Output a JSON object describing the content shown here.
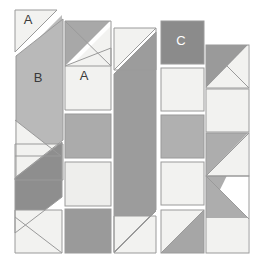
{
  "figure": {
    "type": "geometric-tile-diagram",
    "width": 256,
    "height": 266,
    "background": "#ffffff",
    "stroke": "#9a9a9a",
    "stroke_width": 1
  },
  "palette": {
    "white": "#f4f4f2",
    "light": "#ededea",
    "light2": "#e8e8e5",
    "mid_light": "#cccccc",
    "mid": "#b4b4b4",
    "mid_gray": "#a8a8a8",
    "gray": "#9c9c9c",
    "dark_gray": "#8e8e8e",
    "darker": "#848484",
    "outline": "#8f8f8f",
    "label_dark": "#3a3a3a",
    "label_light": "#ffffff"
  },
  "labels": [
    {
      "id": "label-a1",
      "text": "A",
      "x": 28,
      "y": 21,
      "color": "#3a3a3a"
    },
    {
      "id": "label-b",
      "text": "B",
      "x": 38,
      "y": 79,
      "color": "#3a3a3a"
    },
    {
      "id": "label-a2",
      "text": "A",
      "x": 84,
      "y": 77,
      "color": "#3a3a3a"
    },
    {
      "id": "label-c",
      "text": "C",
      "x": 181,
      "y": 42,
      "color": "#ffffff"
    }
  ],
  "columns": [
    {
      "id": "column-1",
      "x": 14,
      "width": 50,
      "top": 9,
      "bottom": 253,
      "tiles": [
        {
          "id": "c1-tile-1",
          "kind": "diagonal-split",
          "fill_a": "#f2f2f0",
          "fill_b": "#b9b9b9"
        },
        {
          "id": "c1-tile-2",
          "kind": "parallelogram",
          "fill_a": "#b9b9b9"
        },
        {
          "id": "c1-tile-3",
          "kind": "diagonal-split",
          "fill_a": "#f2f2f0",
          "fill_b": "#f2f2f0"
        },
        {
          "id": "c1-tile-4",
          "kind": "parallelogram",
          "fill_a": "#8e8e8e"
        },
        {
          "id": "c1-tile-5",
          "kind": "diagonal-split",
          "fill_a": "#f2f2f0",
          "fill_b": "#f2f2f0"
        }
      ]
    },
    {
      "id": "column-2",
      "x": 64,
      "width": 48,
      "top": 20,
      "bottom": 253,
      "tiles": [
        {
          "id": "c2-tile-1",
          "kind": "diagonal-split",
          "fill_a": "#a8a8a8",
          "fill_b": "#f2f2f0"
        },
        {
          "id": "c2-tile-2",
          "kind": "square",
          "fill_a": "#f2f2f0"
        },
        {
          "id": "c2-tile-3",
          "kind": "square",
          "fill_a": "#ababab"
        },
        {
          "id": "c2-tile-4",
          "kind": "square",
          "fill_a": "#eeeeec"
        },
        {
          "id": "c2-tile-5",
          "kind": "square",
          "fill_a": "#9a9a9a"
        }
      ]
    },
    {
      "id": "column-3",
      "x": 113,
      "width": 45,
      "top": 27,
      "bottom": 253,
      "tiles": [
        {
          "id": "c3-tile-1",
          "kind": "diagonal-split",
          "fill_a": "#f2f2f0",
          "fill_b": "#9c9c9c"
        },
        {
          "id": "c3-tile-2",
          "kind": "parallelogram",
          "fill_a": "#9c9c9c"
        },
        {
          "id": "c3-tile-3",
          "kind": "diagonal-split",
          "fill_a": "#f2f2f0",
          "fill_b": "#f2f2f0"
        }
      ]
    },
    {
      "id": "column-4",
      "x": 160,
      "width": 44,
      "top": 20,
      "bottom": 253,
      "tiles": [
        {
          "id": "c4-tile-1",
          "kind": "square",
          "fill_a": "#8b8b8b"
        },
        {
          "id": "c4-tile-2",
          "kind": "square",
          "fill_a": "#f2f2f0"
        },
        {
          "id": "c4-tile-3",
          "kind": "square",
          "fill_a": "#b0b0b0"
        },
        {
          "id": "c4-tile-4",
          "kind": "square",
          "fill_a": "#f2f2f0"
        },
        {
          "id": "c4-tile-5",
          "kind": "diagonal-split",
          "fill_a": "#f2f2f0",
          "fill_b": "#a6a6a6"
        }
      ]
    },
    {
      "id": "column-5",
      "x": 205,
      "width": 45,
      "top": 44,
      "bottom": 253,
      "tiles": [
        {
          "id": "c5-tile-1",
          "kind": "diagonal-split",
          "fill_a": "#9a9a9a",
          "fill_b": "#f2f2f0"
        },
        {
          "id": "c5-tile-2",
          "kind": "square",
          "fill_a": "#f2f2f0"
        },
        {
          "id": "c5-tile-3",
          "kind": "parallelogram",
          "fill_a": "#adadad"
        },
        {
          "id": "c5-tile-4",
          "kind": "diagonal-split",
          "fill_a": "#f2f2f0",
          "fill_b": "#adadad"
        }
      ]
    }
  ]
}
